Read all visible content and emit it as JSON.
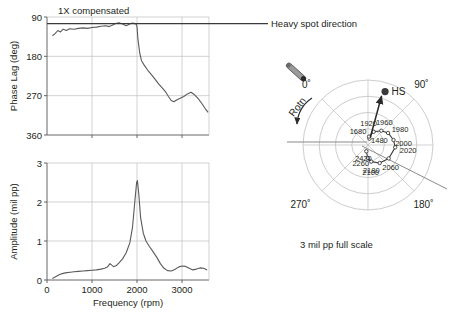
{
  "figure": {
    "caption_polar": "3 mil pp full scale"
  },
  "phase_plot": {
    "annotation": "1X compensated",
    "ylabel": "Phase Lag (deg)",
    "yticks": [
      "90",
      "180",
      "270",
      "360"
    ],
    "heavy_spot_label": "Heavy spot direction"
  },
  "amplitude_plot": {
    "ylabel": "Amplitude (mil pp)",
    "xlabel": "Frequency (rpm)",
    "yticks": [
      "0",
      "1",
      "2",
      "3"
    ],
    "xticks": [
      "0",
      "1000",
      "2000",
      "3000"
    ]
  },
  "polar_plot": {
    "angles": [
      "0˚",
      "90˚",
      "180˚",
      "270˚"
    ],
    "rotation_label": "Rotn",
    "heavy_spot_marker": "HS",
    "speed_labels": [
      "1480",
      "1680",
      "1920",
      "1960",
      "1980",
      "2000",
      "2020",
      "2060",
      "2100",
      "2180",
      "2260",
      "2420"
    ]
  },
  "chart_data": [
    {
      "type": "line",
      "title": "1X compensated",
      "xlabel": "",
      "ylabel": "Phase Lag (deg)",
      "xlim": [
        0,
        3600
      ],
      "ylim": [
        90,
        360
      ],
      "y_inverted": false,
      "grid": true,
      "yticks": [
        90,
        180,
        270,
        360
      ],
      "xticks": [
        0,
        1000,
        2000,
        3000
      ],
      "reference_line_y": 105,
      "x": [
        120,
        180,
        240,
        300,
        360,
        430,
        500,
        600,
        700,
        800,
        900,
        1000,
        1100,
        1200,
        1300,
        1380,
        1450,
        1520,
        1600,
        1680,
        1760,
        1840,
        1900,
        1950,
        1980,
        2000,
        2020,
        2060,
        2100,
        2160,
        2240,
        2320,
        2400,
        2480,
        2560,
        2640,
        2700,
        2760,
        2820,
        2880,
        2960,
        3040,
        3120,
        3200,
        3280,
        3360,
        3440,
        3520,
        3580
      ],
      "y": [
        133,
        128,
        121,
        124,
        118,
        121,
        117,
        118,
        116,
        115,
        116,
        114,
        113,
        111,
        110,
        112,
        109,
        105,
        103,
        106,
        110,
        106,
        104,
        105,
        106,
        112,
        140,
        172,
        190,
        200,
        212,
        222,
        232,
        243,
        252,
        262,
        272,
        281,
        284,
        280,
        276,
        272,
        266,
        262,
        268,
        277,
        288,
        300,
        308
      ]
    },
    {
      "type": "line",
      "title": "",
      "xlabel": "Frequency (rpm)",
      "ylabel": "Amplitude (mil pp)",
      "xlim": [
        0,
        3600
      ],
      "ylim": [
        0,
        3
      ],
      "grid": true,
      "yticks": [
        0,
        1,
        2,
        3
      ],
      "xticks": [
        0,
        1000,
        2000,
        3000
      ],
      "x": [
        120,
        200,
        280,
        360,
        440,
        520,
        600,
        700,
        800,
        900,
        1000,
        1100,
        1200,
        1280,
        1340,
        1400,
        1440,
        1480,
        1540,
        1600,
        1680,
        1760,
        1840,
        1900,
        1950,
        1990,
        2010,
        2040,
        2080,
        2140,
        2200,
        2280,
        2360,
        2440,
        2520,
        2600,
        2680,
        2760,
        2840,
        2920,
        3000,
        3080,
        3160,
        3240,
        3320,
        3400,
        3480,
        3560
      ],
      "y": [
        0.04,
        0.09,
        0.14,
        0.17,
        0.19,
        0.2,
        0.21,
        0.22,
        0.23,
        0.24,
        0.25,
        0.26,
        0.28,
        0.3,
        0.33,
        0.42,
        0.38,
        0.34,
        0.37,
        0.44,
        0.54,
        0.7,
        0.95,
        1.35,
        2.0,
        2.5,
        2.55,
        2.2,
        1.6,
        1.2,
        1.0,
        0.85,
        0.72,
        0.58,
        0.42,
        0.3,
        0.24,
        0.23,
        0.27,
        0.33,
        0.36,
        0.35,
        0.3,
        0.26,
        0.28,
        0.31,
        0.3,
        0.26
      ]
    },
    {
      "type": "scatter",
      "title": "3 mil pp full scale",
      "plot_kind": "polar-nyquist",
      "full_scale_mil_pp": 3,
      "angle_ticks": [
        0,
        90,
        180,
        270
      ],
      "heavy_spot_angle_deg": 62,
      "heavy_spot_radius_frac": 0.82,
      "labeled_points": [
        {
          "speed": 1480,
          "angle_deg": 58,
          "r_frac": 0.1
        },
        {
          "speed": 1680,
          "angle_deg": 52,
          "r_frac": 0.13
        },
        {
          "speed": 1920,
          "angle_deg": 68,
          "r_frac": 0.22
        },
        {
          "speed": 1960,
          "angle_deg": 88,
          "r_frac": 0.3
        },
        {
          "speed": 1980,
          "angle_deg": 104,
          "r_frac": 0.36
        },
        {
          "speed": 2000,
          "angle_deg": 124,
          "r_frac": 0.4
        },
        {
          "speed": 2020,
          "angle_deg": 140,
          "r_frac": 0.42
        },
        {
          "speed": 2060,
          "angle_deg": 168,
          "r_frac": 0.38
        },
        {
          "speed": 2100,
          "angle_deg": 192,
          "r_frac": 0.33
        },
        {
          "speed": 2180,
          "angle_deg": 214,
          "r_frac": 0.26
        },
        {
          "speed": 2260,
          "angle_deg": 226,
          "r_frac": 0.2
        },
        {
          "speed": 2420,
          "angle_deg": 240,
          "r_frac": 0.1
        }
      ]
    }
  ]
}
